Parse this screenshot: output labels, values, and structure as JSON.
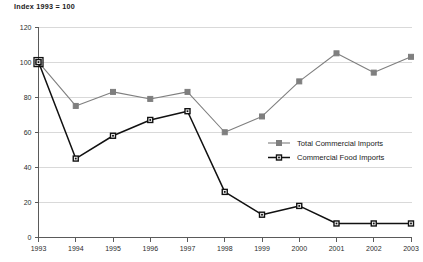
{
  "chart_data": {
    "type": "line",
    "title": "Index 1993 = 100",
    "xlabel": "",
    "ylabel": "",
    "xlim": [
      1993,
      2003
    ],
    "ylim": [
      0,
      120
    ],
    "ytick_step": 20,
    "grid": "horizontal",
    "legend_position": "center-right-inside",
    "categories": [
      "1993",
      "1994",
      "1995",
      "1996",
      "1997",
      "1998",
      "1999",
      "2000",
      "2001",
      "2002",
      "2003"
    ],
    "series": [
      {
        "name": "Total Commercial Imports",
        "color": "#7f7f7f",
        "marker": "filled-square",
        "values": [
          100,
          75,
          83,
          79,
          83,
          60,
          69,
          89,
          105,
          94,
          103
        ]
      },
      {
        "name": "Commercial Food Imports",
        "color": "#111111",
        "marker": "open-square",
        "values": [
          100,
          45,
          58,
          67,
          72,
          26,
          13,
          18,
          8,
          8,
          8
        ]
      }
    ],
    "ytick_labels": [
      "0",
      "20",
      "40",
      "60",
      "80",
      "100",
      "120"
    ],
    "xtick_labels": [
      "1993",
      "1994",
      "1995",
      "1996",
      "1997",
      "1998",
      "1999",
      "2000",
      "2001",
      "2002",
      "2003"
    ]
  },
  "legend": {
    "items": [
      {
        "label": "Total Commercial Imports"
      },
      {
        "label": "Commercial Food Imports"
      }
    ]
  }
}
